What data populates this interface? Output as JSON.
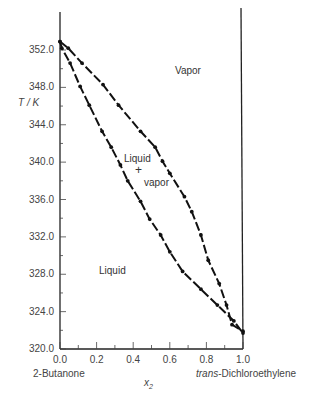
{
  "chart_data": {
    "type": "line",
    "title": "",
    "xlabel": "x2",
    "ylabel": "T / K",
    "xlim": [
      0.0,
      1.0
    ],
    "ylim": [
      320.0,
      352.0
    ],
    "x_ticks": [
      "0.0",
      "0.2",
      "0.4",
      "0.6",
      "0.8",
      "1.0"
    ],
    "y_ticks": [
      "352.0",
      "348.0",
      "344.0",
      "340.0",
      "336.0",
      "332.0",
      "328.0",
      "324.0",
      "320.0"
    ],
    "x_end_labels": {
      "left": "2-Butanone",
      "right_prefix": "trans",
      "right_suffix": "-Dichloroethylene"
    },
    "grid": false,
    "annotations": [
      "Vapor",
      "Liquid",
      "Liquid",
      "+",
      "vapor"
    ],
    "series": [
      {
        "name": "Liquid (bubble point)",
        "x": [
          0.0,
          0.01,
          0.055,
          0.11,
          0.16,
          0.23,
          0.28,
          0.33,
          0.37,
          0.44,
          0.49,
          0.55,
          0.6,
          0.67,
          0.77,
          0.86,
          0.95,
          1.0
        ],
        "y": [
          352.9,
          352.2,
          350.6,
          348.1,
          346.1,
          343.3,
          341.6,
          339.7,
          338.0,
          335.8,
          333.9,
          332.2,
          330.4,
          328.3,
          326.4,
          324.7,
          323.0,
          321.7
        ]
      },
      {
        "name": "Vapor (dew point)",
        "x": [
          0.0,
          0.045,
          0.12,
          0.235,
          0.32,
          0.44,
          0.52,
          0.56,
          0.6,
          0.68,
          0.72,
          0.77,
          0.81,
          0.87,
          0.91,
          0.94,
          1.0
        ],
        "y": [
          352.9,
          352.2,
          350.6,
          348.3,
          346.1,
          343.3,
          341.6,
          340.1,
          338.8,
          336.3,
          334.7,
          332.2,
          329.5,
          327.0,
          324.7,
          322.6,
          321.9
        ]
      }
    ]
  },
  "labels": {
    "y_axis": "T / K",
    "x_axis": "x",
    "x_axis_sub": "2",
    "vapor_region": "Vapor",
    "liquid_region": "Liquid",
    "two_phase_line1": "Liquid",
    "two_phase_line2": "+",
    "two_phase_line3": "vapor",
    "left_component": "2-Butanone",
    "right_component_italic": "trans",
    "right_component_rest": "-Dichloroethylene"
  }
}
